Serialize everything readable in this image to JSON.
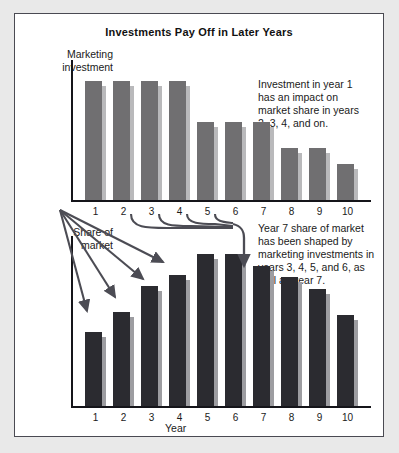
{
  "title": "Investments Pay Off in Later Years",
  "captions": {
    "marketing": "Marketing\ninvestment",
    "share": "Share of\nmarket",
    "year_axis": "Year"
  },
  "annotations": {
    "first": "Investment in year 1 has an impact on market share in years 2, 3, 4, and on.",
    "second": "Year 7 share of market has been shaped by marketing investments in years 3, 4, 5, and 6, as well as year 7."
  },
  "colors": {
    "marketing_bar": "#706f71",
    "marketing_bar_shadow": "#b9b9bb",
    "share_bar": "#2b2b30",
    "share_bar_shadow": "#9d9da1",
    "axis": "#15151a",
    "frame": "#4a4a52",
    "panel_bg": "#ffffff",
    "page_bg": "#e9e9e9",
    "arrow": "#4c4c54",
    "text": "#1a1a1a"
  },
  "chart_data": [
    {
      "type": "bar",
      "title": "Marketing investment",
      "xlabel": "Year",
      "ylabel": "Marketing investment",
      "categories": [
        "1",
        "2",
        "3",
        "4",
        "5",
        "6",
        "7",
        "8",
        "9",
        "10"
      ],
      "values": [
        100,
        100,
        100,
        100,
        66,
        66,
        66,
        44,
        44,
        30
      ],
      "ylim": [
        0,
        118
      ],
      "grid": false,
      "legend": "none"
    },
    {
      "type": "bar",
      "title": "Share of market",
      "xlabel": "Year",
      "ylabel": "Share of market",
      "categories": [
        "1",
        "2",
        "3",
        "4",
        "5",
        "6",
        "7",
        "8",
        "9",
        "10"
      ],
      "values": [
        49,
        62,
        79,
        86,
        100,
        100,
        92,
        85,
        77,
        60
      ],
      "ylim": [
        0,
        112
      ],
      "grid": false,
      "legend": "none"
    }
  ]
}
